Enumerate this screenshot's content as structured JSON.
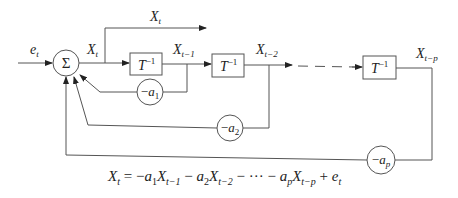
{
  "diagram": {
    "type": "block-diagram",
    "input_label": "e_t",
    "sum_symbol": "Σ",
    "output_label": "X_t",
    "sum_output_label": "X_t",
    "delay_label": "T",
    "delay_exponent": "−1",
    "delays": [
      {
        "id": "delay1",
        "output_label": "X",
        "output_sub": "t−1"
      },
      {
        "id": "delay2",
        "output_label": "X",
        "output_sub": "t−2"
      },
      {
        "id": "delayp",
        "output_label": "X",
        "output_sub": "t−p"
      }
    ],
    "gains": [
      {
        "id": "gain1",
        "sign": "−",
        "coef": "a",
        "sub": "1"
      },
      {
        "id": "gain2",
        "sign": "−",
        "coef": "a",
        "sub": "2"
      },
      {
        "id": "gainp",
        "sign": "−",
        "coef": "a",
        "sub": "p"
      }
    ],
    "labels": {
      "e": "e",
      "e_sub": "t",
      "x": "X",
      "x_sub": "t"
    },
    "formula": "X_t = −a_1 X_{t−1} − a_2 X_{t−2} − ··· − a_p X_{t−p} + e_t",
    "formula_parts": {
      "lhs_X": "X",
      "lhs_sub": "t",
      "eq": " = −",
      "a1": "a",
      "a1_sub": "1",
      "x1": "X",
      "x1_sub": "t−1",
      "minus2": " − ",
      "a2": "a",
      "a2_sub": "2",
      "x2": "X",
      "x2_sub": "t−2",
      "dots": " − ··· − ",
      "ap": "a",
      "ap_sub": "p",
      "xp": "X",
      "xp_sub": "t−p",
      "plus": " + ",
      "e": "e",
      "e_sub": "t"
    },
    "colors": {
      "line": "#555555",
      "text": "#222222",
      "background": "#ffffff"
    }
  }
}
